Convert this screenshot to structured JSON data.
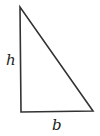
{
  "diagram": {
    "type": "right-triangle",
    "vertices": {
      "top": [
        20,
        7
      ],
      "bottom_left": [
        21,
        112
      ],
      "bottom_right": [
        93,
        111
      ]
    },
    "stroke_color": "#333333",
    "labels": {
      "height": "h",
      "base": "b"
    }
  }
}
